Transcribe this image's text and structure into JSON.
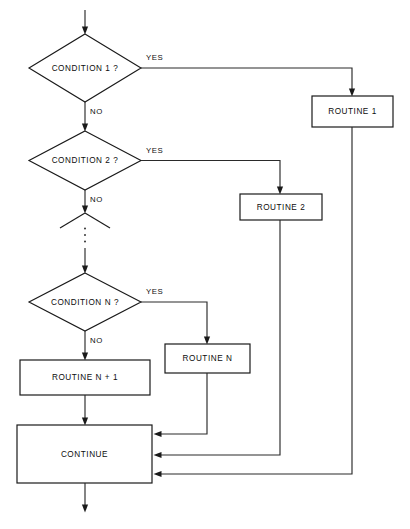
{
  "diagram": {
    "type": "flowchart",
    "background_color": "#ffffff",
    "line_color": "#1a1a1a",
    "nodes": {
      "decision_1": {
        "label": "CONDITION 1 ?",
        "shape": "diamond"
      },
      "decision_2": {
        "label": "CONDITION 2 ?",
        "shape": "diamond"
      },
      "decision_n": {
        "label": "CONDITION N ?",
        "shape": "diamond"
      },
      "decision_partial": {
        "label": "",
        "shape": "partial-diamond"
      },
      "routine_1": {
        "label": "ROUTINE 1",
        "shape": "rectangle"
      },
      "routine_2": {
        "label": "ROUTINE 2",
        "shape": "rectangle"
      },
      "routine_n": {
        "label": "ROUTINE N",
        "shape": "rectangle"
      },
      "routine_n_plus_1": {
        "label": "ROUTINE N + 1",
        "shape": "rectangle"
      },
      "continue": {
        "label": "CONTINUE",
        "shape": "rectangle"
      }
    },
    "edge_labels": {
      "yes_1": "YES",
      "no_1": "NO",
      "yes_2": "YES",
      "no_2": "NO",
      "yes_n": "YES",
      "no_n": "NO"
    },
    "ellipsis": "⋮"
  }
}
